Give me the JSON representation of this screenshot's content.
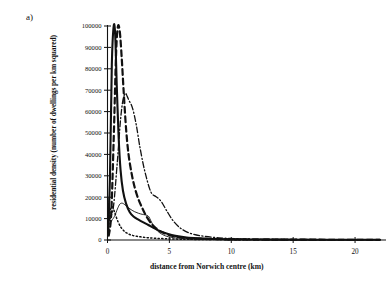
{
  "figure": {
    "panel_label": "a)",
    "background_color": "#ffffff",
    "ink_color": "#111111"
  },
  "chart_data": {
    "type": "line",
    "title": "",
    "subtitle": "",
    "xlabel": "distance from Norwich centre (km)",
    "ylabel": "residential density (number of dwellings per km squared)",
    "xlim": [
      0,
      22.5
    ],
    "ylim": [
      0,
      100000
    ],
    "xticks": [
      0,
      5,
      10,
      15,
      20
    ],
    "xtick_labels": [
      "0",
      "5",
      "10",
      "15",
      "20"
    ],
    "yticks": [
      0,
      10000,
      20000,
      30000,
      40000,
      50000,
      60000,
      70000,
      80000,
      90000,
      100000
    ],
    "ytick_labels": [
      "0",
      "10000",
      "20000",
      "30000",
      "40000",
      "50000",
      "60000",
      "70000",
      "80000",
      "90000",
      "100000"
    ],
    "grid": false,
    "legend": "none",
    "legend_position": "none",
    "annotations": [],
    "series": [
      {
        "name": "series-1-thick-solid",
        "style": "solid",
        "width": 2.1,
        "color": "#111111",
        "x": [
          0.05,
          0.2,
          0.35,
          0.5,
          0.62,
          0.75,
          0.9,
          1.05,
          1.25,
          1.5,
          1.8,
          2.1,
          2.5,
          2.9,
          3.3,
          3.8,
          4.3,
          4.9,
          5.6,
          6.4,
          7.3,
          8.5,
          10.0,
          12.0,
          14.0,
          16.0,
          18.0,
          20.0,
          22.0
        ],
        "values": [
          3000,
          30000,
          82000,
          101000,
          96000,
          72000,
          48000,
          33000,
          23000,
          17000,
          13000,
          11000,
          9500,
          8200,
          7000,
          5400,
          4000,
          2800,
          1800,
          1100,
          750,
          480,
          300,
          200,
          160,
          130,
          110,
          100,
          95
        ]
      },
      {
        "name": "series-2-thick-dashed",
        "style": "dashed",
        "width": 2.2,
        "color": "#111111",
        "x": [
          0.1,
          0.3,
          0.5,
          0.7,
          0.85,
          1.0,
          1.15,
          1.3,
          1.5,
          1.7,
          1.95,
          2.2,
          2.5,
          2.8,
          3.1,
          3.5,
          3.9,
          4.4,
          5.0,
          5.7,
          6.5,
          7.5,
          9.0,
          11.0,
          13.5,
          16.0,
          19.0,
          22.0
        ],
        "values": [
          2000,
          12000,
          47000,
          88000,
          101000,
          97000,
          85000,
          70000,
          52000,
          40000,
          31000,
          24500,
          19000,
          15000,
          11500,
          8000,
          5600,
          3700,
          2300,
          1400,
          900,
          600,
          380,
          250,
          180,
          140,
          115,
          100
        ]
      },
      {
        "name": "series-3-dash-dot",
        "style": "dashdot",
        "width": 1.3,
        "color": "#111111",
        "x": [
          0.05,
          0.25,
          0.5,
          0.8,
          1.05,
          1.25,
          1.45,
          1.6,
          1.75,
          1.9,
          2.1,
          2.35,
          2.6,
          2.9,
          3.15,
          3.4,
          3.6,
          3.85,
          4.1,
          4.4,
          4.8,
          5.3,
          5.9,
          6.6,
          7.5,
          9.0,
          11.0,
          13.5,
          16.5,
          19.5,
          22.0
        ],
        "values": [
          11500,
          11000,
          16500,
          37000,
          56000,
          65500,
          68500,
          67000,
          65000,
          63500,
          60000,
          53000,
          44000,
          35000,
          29000,
          24000,
          21500,
          20500,
          19500,
          17500,
          13500,
          9000,
          5500,
          3300,
          2000,
          1000,
          520,
          320,
          220,
          160,
          130
        ]
      },
      {
        "name": "series-4-thin-solid",
        "style": "solid",
        "width": 0.9,
        "color": "#111111",
        "x": [
          0.05,
          0.2,
          0.4,
          0.6,
          0.8,
          1.0,
          1.2,
          1.4,
          1.6,
          1.9,
          2.2,
          2.5,
          2.8,
          3.0,
          3.2,
          3.35,
          3.5,
          3.7,
          3.95,
          4.25,
          4.7,
          5.2,
          5.9,
          6.8,
          8.0,
          10.0,
          12.5,
          15.5,
          18.5,
          22.0
        ],
        "values": [
          19500,
          9000,
          9600,
          11500,
          14500,
          16800,
          17200,
          16500,
          15500,
          14200,
          13200,
          12500,
          12000,
          11800,
          11500,
          10800,
          9000,
          6800,
          4800,
          3200,
          1900,
          1200,
          750,
          480,
          320,
          210,
          160,
          130,
          110,
          95
        ]
      },
      {
        "name": "series-5-dotted",
        "style": "dotted",
        "width": 1.5,
        "color": "#111111",
        "x": [
          0.05,
          0.2,
          0.4,
          0.6,
          0.85,
          1.1,
          1.4,
          1.7,
          2.0,
          2.4,
          2.9,
          3.4,
          4.0,
          4.7,
          5.5,
          6.5,
          8.0,
          10.0,
          13.0,
          16.0,
          19.0,
          22.0
        ],
        "values": [
          2200,
          13000,
          15500,
          12500,
          8500,
          5800,
          3900,
          2800,
          2200,
          1700,
          1300,
          1000,
          780,
          580,
          430,
          320,
          230,
          170,
          130,
          110,
          100,
          95
        ]
      }
    ]
  }
}
